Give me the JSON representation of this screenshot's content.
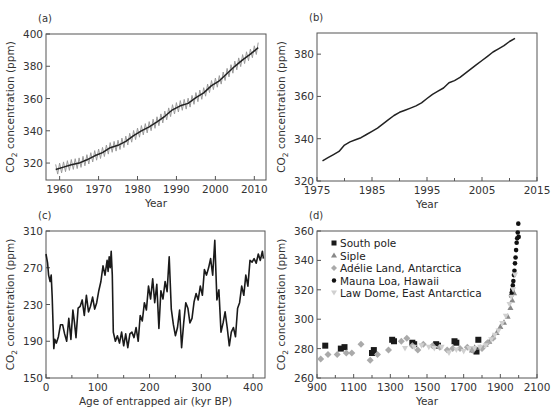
{
  "chart_data": [
    {
      "id": "a",
      "panel_label": "(a)",
      "type": "line",
      "title": "",
      "xlabel": "Year",
      "ylabel": "CO2 concentration (ppm)",
      "xlim": [
        1956.5,
        2013
      ],
      "ylim": [
        309.5,
        400
      ],
      "xticks": [
        1960,
        1970,
        1980,
        1990,
        2000,
        2010
      ],
      "yticks": [
        320,
        340,
        360,
        380,
        400
      ],
      "grid": false,
      "series": [
        {
          "name": "Monthly (seasonal cycle)",
          "color": "#9a9a9a",
          "style": "seasonal"
        },
        {
          "name": "Annual mean",
          "color": "#222222",
          "x": [
            1959,
            1961,
            1963,
            1965,
            1967,
            1969,
            1971,
            1973,
            1975,
            1977,
            1979,
            1981,
            1983,
            1985,
            1987,
            1989,
            1991,
            1993,
            1995,
            1997,
            1999,
            2001,
            2003,
            2005,
            2007,
            2009,
            2011
          ],
          "values": [
            316,
            317.5,
            319,
            320,
            322,
            324.5,
            326.5,
            329.5,
            331,
            333.5,
            337,
            340,
            342.5,
            345.5,
            349,
            353,
            355.5,
            357,
            360.5,
            363.5,
            368,
            371,
            375.5,
            380,
            384,
            387.5,
            391.5
          ]
        }
      ],
      "box": {
        "x0": 46,
        "x1": 266,
        "y0": 34,
        "y1": 180
      }
    },
    {
      "id": "b",
      "panel_label": "(b)",
      "type": "line",
      "title": "",
      "xlabel": "Year",
      "ylabel": "CO2 concentration (ppm)",
      "xlim": [
        1975,
        2015
      ],
      "ylim": [
        320,
        390
      ],
      "xticks": [
        1975,
        1985,
        1995,
        2005,
        2015
      ],
      "yticks": [
        320,
        340,
        360,
        380
      ],
      "grid": false,
      "series": [
        {
          "name": "CO2",
          "color": "#222222",
          "x": [
            1976,
            1977,
            1978,
            1979,
            1980,
            1981,
            1982,
            1983,
            1984,
            1985,
            1986,
            1987,
            1988,
            1989,
            1990,
            1991,
            1992,
            1993,
            1994,
            1995,
            1996,
            1997,
            1998,
            1999,
            2000,
            2001,
            2002,
            2003,
            2004,
            2005,
            2006,
            2007,
            2008,
            2009,
            2010,
            2011
          ],
          "values": [
            329.5,
            331,
            332.5,
            334,
            337,
            338.5,
            339.5,
            340.5,
            342,
            343.5,
            345,
            347,
            349,
            351,
            352.5,
            353.5,
            354.5,
            355.5,
            357,
            359,
            361,
            362.5,
            364,
            366.5,
            367.5,
            369,
            371,
            373,
            375,
            377,
            379,
            381,
            382.5,
            384,
            386,
            387.5
          ]
        }
      ],
      "box": {
        "x0": 317,
        "x1": 537,
        "y0": 33,
        "y1": 181
      }
    },
    {
      "id": "c",
      "panel_label": "(c)",
      "type": "line",
      "title": "",
      "xlabel": "Age of entrapped air (kyr BP)",
      "ylabel": "CO2 concentration (ppm)",
      "xlim": [
        0,
        423
      ],
      "ylim": [
        150,
        310
      ],
      "xticks": [
        0,
        100,
        200,
        300,
        400
      ],
      "yticks": [
        150,
        190,
        230,
        270,
        310
      ],
      "grid": false,
      "series": [
        {
          "name": "Vostok ice core CO2",
          "color": "#1a1a1a",
          "x": [
            0,
            3,
            5,
            8,
            10,
            12,
            15,
            17,
            20,
            24,
            28,
            32,
            36,
            40,
            44,
            48,
            52,
            55,
            58,
            62,
            66,
            70,
            74,
            78,
            82,
            86,
            90,
            94,
            98,
            102,
            106,
            110,
            114,
            118,
            120,
            122,
            124,
            126,
            128,
            130,
            134,
            138,
            142,
            146,
            150,
            154,
            158,
            162,
            166,
            170,
            174,
            178,
            182,
            186,
            190,
            194,
            198,
            202,
            206,
            210,
            214,
            218,
            222,
            226,
            230,
            234,
            238,
            242,
            246,
            250,
            254,
            258,
            262,
            266,
            270,
            274,
            278,
            282,
            286,
            290,
            294,
            298,
            302,
            306,
            310,
            314,
            318,
            322,
            326,
            330,
            334,
            338,
            342,
            346,
            350,
            354,
            358,
            362,
            366,
            370,
            374,
            378,
            382,
            386,
            390,
            394,
            398,
            402,
            406,
            410,
            414,
            418,
            420
          ],
          "values": [
            285,
            275,
            262,
            255,
            262,
            238,
            182,
            192,
            188,
            195,
            208,
            208,
            198,
            190,
            215,
            192,
            224,
            210,
            194,
            226,
            228,
            235,
            218,
            240,
            222,
            228,
            238,
            225,
            232,
            245,
            255,
            272,
            262,
            278,
            266,
            282,
            270,
            288,
            262,
            200,
            190,
            196,
            188,
            200,
            185,
            198,
            183,
            198,
            200,
            194,
            205,
            190,
            218,
            212,
            232,
            224,
            250,
            236,
            258,
            232,
            252,
            204,
            245,
            236,
            255,
            244,
            282,
            225,
            208,
            196,
            205,
            224,
            183,
            210,
            232,
            226,
            210,
            215,
            233,
            242,
            235,
            250,
            240,
            268,
            262,
            270,
            280,
            262,
            300,
            235,
            246,
            200,
            210,
            222,
            205,
            185,
            200,
            205,
            195,
            226,
            232,
            250,
            240,
            262,
            250,
            278,
            276,
            280,
            275,
            285,
            278,
            288,
            280
          ]
        }
      ],
      "box": {
        "x0": 46,
        "x1": 265,
        "y0": 231,
        "y1": 378
      }
    },
    {
      "id": "d",
      "panel_label": "(d)",
      "type": "scatter",
      "title": "",
      "xlabel": "Year",
      "ylabel": "CO2 concentration (ppm)",
      "xlim": [
        900,
        2100
      ],
      "ylim": [
        260,
        360
      ],
      "xticks": [
        900,
        1100,
        1300,
        1500,
        1700,
        1900,
        2100
      ],
      "yticks": [
        260,
        280,
        300,
        320,
        340,
        360
      ],
      "grid": false,
      "legend_position": "upper left",
      "series": [
        {
          "name": "South pole",
          "marker": "square",
          "color": "#1a1a1a",
          "x": [
            945,
            1030,
            1050,
            1200,
            1210,
            1310,
            1320,
            1420,
            1430,
            1550,
            1560,
            1650,
            1660,
            1760,
            1770,
            1780
          ],
          "values": [
            282,
            280,
            281,
            277,
            279,
            286,
            285,
            284,
            283,
            283,
            282,
            285,
            284,
            279,
            278,
            286
          ]
        },
        {
          "name": "Siple",
          "marker": "triangle",
          "color": "#888888",
          "x": [
            1745,
            1760,
            1790,
            1820,
            1840,
            1860,
            1880,
            1900,
            1920,
            1940,
            1955,
            1965,
            1975
          ],
          "values": [
            279,
            281,
            281,
            283,
            285,
            288,
            291,
            295,
            298,
            302,
            308,
            313,
            318
          ]
        },
        {
          "name": "Adélie Land, Antarctica",
          "marker": "diamond",
          "color": "#aaaaaa",
          "x": [
            920,
            960,
            1010,
            1060,
            1090,
            1140,
            1190,
            1230,
            1290,
            1360,
            1390,
            1420,
            1450,
            1480,
            1530,
            1570,
            1610,
            1640,
            1680,
            1720,
            1750,
            1800,
            1830,
            1860
          ],
          "values": [
            273,
            276,
            276,
            277,
            277,
            283,
            272,
            276,
            279,
            285,
            287,
            282,
            279,
            283,
            282,
            281,
            279,
            280,
            280,
            281,
            279,
            280,
            284,
            287
          ]
        },
        {
          "name": "Mauna Loa, Hawaii",
          "marker": "circle",
          "color": "#111111",
          "x": [
            1959,
            1962,
            1965,
            1968,
            1971,
            1974,
            1977,
            1980,
            1983,
            1986,
            1989,
            1992,
            1995,
            1998,
            2000
          ],
          "values": [
            316,
            318,
            320,
            323,
            326,
            330,
            333,
            338,
            342,
            347,
            352,
            355,
            359,
            365,
            356
          ]
        },
        {
          "name": "Law Dome, East Antarctica",
          "marker": "inverted-triangle",
          "color": "#d0d0d0",
          "x": [
            1380,
            1430,
            1470,
            1510,
            1540,
            1580,
            1620,
            1660,
            1700,
            1730,
            1760,
            1790,
            1820,
            1850,
            1870,
            1890,
            1910,
            1930,
            1950,
            1960,
            1970,
            1980
          ],
          "values": [
            280,
            281,
            282,
            281,
            280,
            281,
            277,
            279,
            278,
            280,
            280,
            281,
            282,
            286,
            289,
            292,
            297,
            302,
            310,
            315,
            320,
            330
          ]
        }
      ],
      "box": {
        "x0": 317,
        "x1": 537,
        "y0": 231,
        "y1": 378
      }
    }
  ]
}
